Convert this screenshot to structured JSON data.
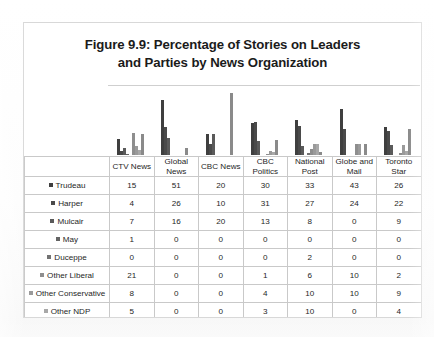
{
  "figure": {
    "title_line1": "Figure 9.9: Percentage of Stories on Leaders",
    "title_line2": "and Parties by News Organization"
  },
  "table": {
    "corner_label": "",
    "column_headers": [
      {
        "line1": "CTV News",
        "line2": ""
      },
      {
        "line1": "Global",
        "line2": "News"
      },
      {
        "line1": "CBC News",
        "line2": ""
      },
      {
        "line1": "CBC",
        "line2": "Politics"
      },
      {
        "line1": "National",
        "line2": "Post"
      },
      {
        "line1": "Globe and",
        "line2": "Mail"
      },
      {
        "line1": "Toronto",
        "line2": "Star"
      }
    ],
    "rows": [
      {
        "label": "Trudeau",
        "swatch": "#3f3f3f",
        "values": [
          "15",
          "51",
          "20",
          "30",
          "33",
          "43",
          "26"
        ]
      },
      {
        "label": "Harper",
        "swatch": "#4a4a4a",
        "values": [
          "4",
          "26",
          "10",
          "31",
          "27",
          "24",
          "22"
        ]
      },
      {
        "label": "Mulcair",
        "swatch": "#5a5a5a",
        "values": [
          "7",
          "16",
          "20",
          "13",
          "8",
          "0",
          "9"
        ]
      },
      {
        "label": "May",
        "swatch": "#646464",
        "values": [
          "1",
          "0",
          "0",
          "0",
          "0",
          "0",
          "0"
        ]
      },
      {
        "label": "Duceppe",
        "swatch": "#727272",
        "values": [
          "0",
          "0",
          "0",
          "0",
          "2",
          "0",
          "0"
        ]
      },
      {
        "label": "Other Liberal",
        "swatch": "#8e8e8e",
        "values": [
          "21",
          "0",
          "0",
          "1",
          "6",
          "10",
          "2"
        ]
      },
      {
        "label": "Other Conservative",
        "swatch": "#9a9a9a",
        "values": [
          "8",
          "0",
          "0",
          "4",
          "10",
          "10",
          "9"
        ]
      },
      {
        "label": "Other NDP",
        "swatch": "#a8a8a8",
        "values": [
          "5",
          "0",
          "0",
          "3",
          "10",
          "0",
          "4"
        ]
      },
      {
        "label": "Non Partisan",
        "swatch": "#8a8a8a",
        "values": [
          "20",
          "7",
          "58",
          "14",
          "3",
          "10",
          "24"
        ]
      }
    ]
  },
  "chart_data": {
    "type": "bar",
    "title": "Figure 9.9: Percentage of Stories on Leaders and Parties by News Organization",
    "xlabel": "",
    "ylabel": "",
    "ylim": [
      0,
      58
    ],
    "grid": false,
    "legend_position": "table-left-column",
    "categories": [
      "CTV News",
      "Global News",
      "CBC News",
      "CBC Politics",
      "National Post",
      "Globe and Mail",
      "Toronto Star"
    ],
    "series": [
      {
        "name": "Trudeau",
        "color": "#3f3f3f",
        "values": [
          15,
          51,
          20,
          30,
          33,
          43,
          26
        ]
      },
      {
        "name": "Harper",
        "color": "#4a4a4a",
        "values": [
          4,
          26,
          10,
          31,
          27,
          24,
          22
        ]
      },
      {
        "name": "Mulcair",
        "color": "#5a5a5a",
        "values": [
          7,
          16,
          20,
          13,
          8,
          0,
          9
        ]
      },
      {
        "name": "May",
        "color": "#646464",
        "values": [
          1,
          0,
          0,
          0,
          0,
          0,
          0
        ]
      },
      {
        "name": "Duceppe",
        "color": "#727272",
        "values": [
          0,
          0,
          0,
          0,
          2,
          0,
          0
        ]
      },
      {
        "name": "Other Liberal",
        "color": "#8e8e8e",
        "values": [
          21,
          0,
          0,
          1,
          6,
          10,
          2
        ]
      },
      {
        "name": "Other Conservative",
        "color": "#9a9a9a",
        "values": [
          8,
          0,
          0,
          4,
          10,
          10,
          9
        ]
      },
      {
        "name": "Other NDP",
        "color": "#a8a8a8",
        "values": [
          5,
          0,
          0,
          3,
          10,
          0,
          4
        ]
      },
      {
        "name": "Non Partisan",
        "color": "#8a8a8a",
        "values": [
          20,
          7,
          58,
          14,
          3,
          10,
          24
        ]
      }
    ]
  }
}
